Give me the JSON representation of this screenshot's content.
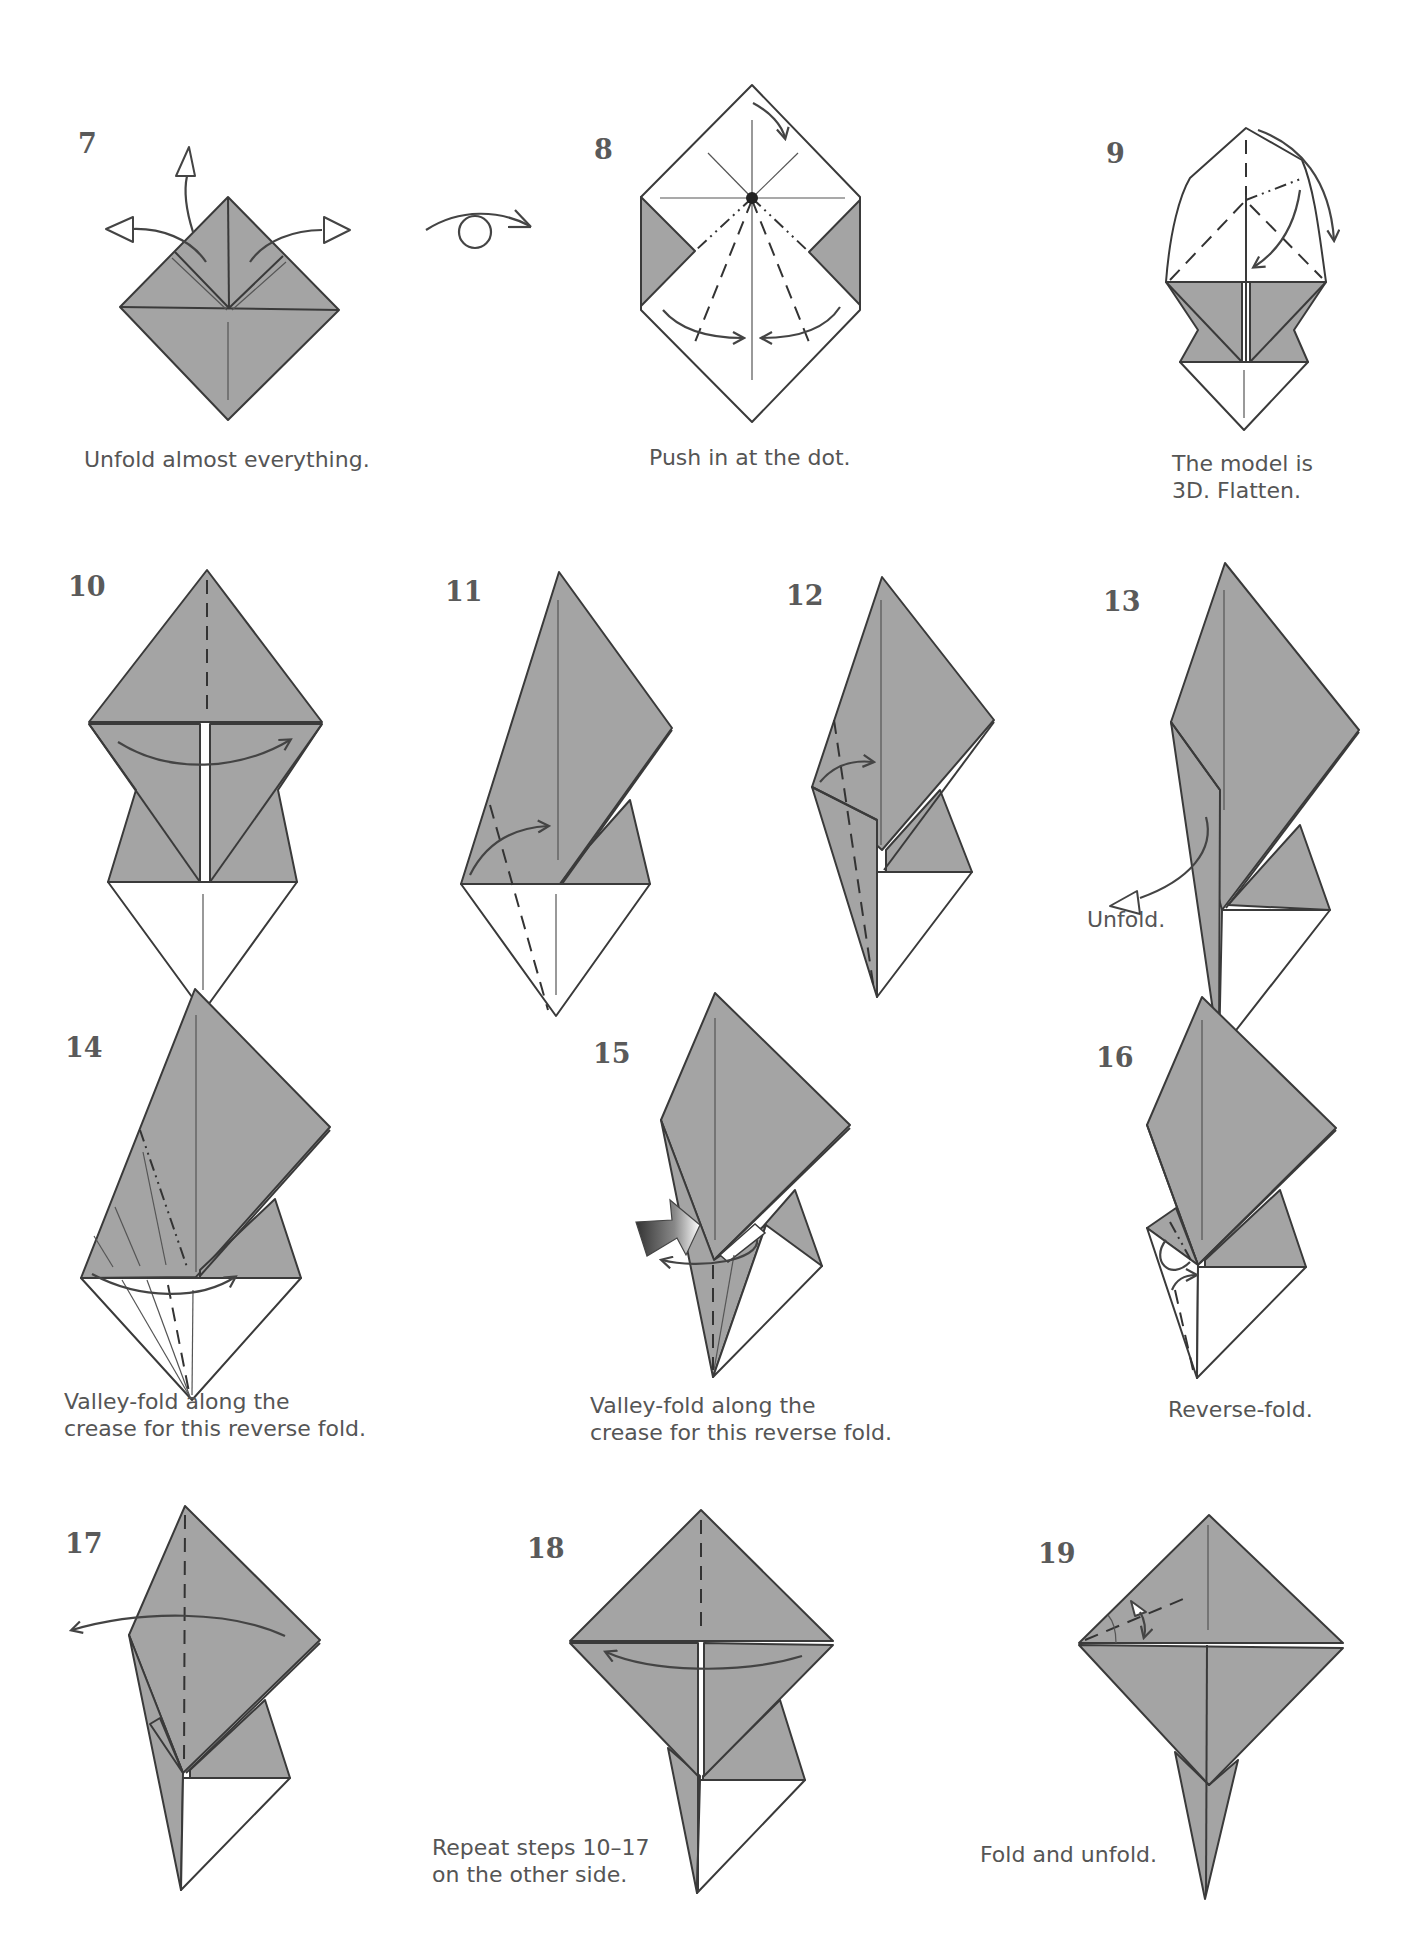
{
  "colors": {
    "paper_gray": "#a4a4a4",
    "line": "#3a3a3a",
    "text": "#555555",
    "background": "#ffffff"
  },
  "symbols": {
    "turn_over": "turn-over-icon",
    "push": "push-arrow-icon"
  },
  "steps": [
    {
      "number": "7",
      "caption": "Unfold almost everything."
    },
    {
      "number": "8",
      "caption": "Push in at the dot."
    },
    {
      "number": "9",
      "caption": "The model is\n3D. Flatten."
    },
    {
      "number": "10",
      "caption": ""
    },
    {
      "number": "11",
      "caption": ""
    },
    {
      "number": "12",
      "caption": ""
    },
    {
      "number": "13",
      "caption": "Unfold."
    },
    {
      "number": "14",
      "caption": "Valley-fold along the\ncrease for this reverse fold."
    },
    {
      "number": "15",
      "caption": "Valley-fold along the\ncrease for this reverse fold."
    },
    {
      "number": "16",
      "caption": "Reverse-fold."
    },
    {
      "number": "17",
      "caption": ""
    },
    {
      "number": "18",
      "caption": "Repeat steps 10–17\non the other side."
    },
    {
      "number": "19",
      "caption": "Fold and unfold."
    }
  ]
}
